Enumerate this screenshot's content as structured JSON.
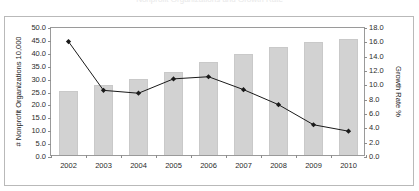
{
  "figure": {
    "title_clipped": "Nonprofit Organizations and Growth Rate",
    "bar_color": "#d2d2d2",
    "line_color": "#1a1a1a",
    "frame_color": "#9a9a9a",
    "outer_border_color": "#b9b9b9"
  },
  "axis_titles": {
    "left": "# Nonprofit Organizations 10,000",
    "right": "Growth Rate %"
  },
  "ticks": {
    "left": [
      "50.0",
      "45.0",
      "40.0",
      "35.0",
      "30.0",
      "25.0",
      "20.0",
      "15.0",
      "10.0",
      "5.0",
      "0.0"
    ],
    "right": [
      "18.0",
      "16.0",
      "14.0",
      "12.0",
      "10.0",
      "8.0",
      "6.0",
      "4.0",
      "2.0",
      "0.0"
    ],
    "x": [
      "2002",
      "2003",
      "2004",
      "2005",
      "2006",
      "2007",
      "2008",
      "2009",
      "2010"
    ]
  },
  "chart_data": {
    "type": "bar",
    "title": "Nonprofit Organizations and Growth Rate",
    "xlabel": "",
    "ylabel": "# Nonprofit Organizations 10,000",
    "y2label": "Growth Rate %",
    "categories": [
      "2002",
      "2003",
      "2004",
      "2005",
      "2006",
      "2007",
      "2008",
      "2009",
      "2010"
    ],
    "ylim": [
      0,
      50
    ],
    "y2lim": [
      0,
      18
    ],
    "ytick_step": 5,
    "y2tick_step": 2,
    "grid": false,
    "legend": "none",
    "series": [
      {
        "name": "# Nonprofit Organizations 10,000",
        "type": "bar",
        "axis": "left",
        "values": [
          25.0,
          27.3,
          29.5,
          32.0,
          36.1,
          39.2,
          42.0,
          43.7,
          45.1
        ]
      },
      {
        "name": "Growth Rate %",
        "type": "line",
        "axis": "right",
        "marker": "diamond",
        "values": [
          16.1,
          9.3,
          8.9,
          10.9,
          11.2,
          9.4,
          7.3,
          4.5,
          3.6
        ]
      }
    ]
  }
}
